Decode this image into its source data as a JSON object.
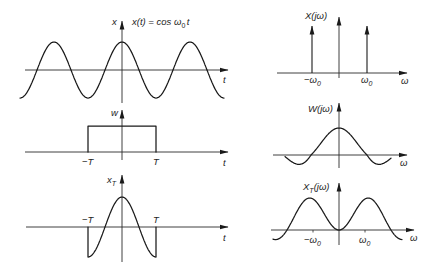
{
  "diagram_data": {
    "type": "signal-and-spectrum-panels",
    "description": "Windowing of a cosine: time-domain signals (left) and their Fourier transforms (right)",
    "left_panels": [
      {
        "id": "x",
        "signal": "x(t) = cos ω0 t",
        "shape": "cosine",
        "horizontal_axis": "t"
      },
      {
        "id": "w",
        "signal": "w(t)",
        "shape": "rectangular window from -T to T",
        "horizontal_axis": "t"
      },
      {
        "id": "xT",
        "signal": "x_T(t) = x(t) w(t)",
        "shape": "cosine truncated to [-T, T]",
        "horizontal_axis": "t"
      }
    ],
    "right_panels": [
      {
        "id": "X",
        "signal": "X(jω)",
        "shape": "impulses at -ω0 and ω0",
        "horizontal_axis": "ω"
      },
      {
        "id": "W",
        "signal": "W(jω)",
        "shape": "sinc centered at 0",
        "horizontal_axis": "ω"
      },
      {
        "id": "XT",
        "signal": "X_T(jω)",
        "shape": "sum of sincs centered at -ω0 and ω0",
        "horizontal_axis": "ω"
      }
    ]
  },
  "left": {
    "x": {
      "axis_label": "x",
      "formula_main": "x(t) = cos ω",
      "formula_sub": "0",
      "formula_tail": "t",
      "horizontal_label": "t"
    },
    "w": {
      "axis_label": "w",
      "neg_tick": "−T",
      "pos_tick": "T",
      "horizontal_label": "t"
    },
    "xT": {
      "axis_label_main": "x",
      "axis_label_sub": "T",
      "neg_tick": "−T",
      "pos_tick": "T",
      "horizontal_label": "t"
    }
  },
  "right": {
    "X": {
      "label": "X(jω)",
      "neg_tick_main": "−ω",
      "neg_tick_sub": "0",
      "pos_tick_main": "ω",
      "pos_tick_sub": "0",
      "horizontal_label": "ω"
    },
    "W": {
      "label": "W(jω)",
      "horizontal_label": "ω"
    },
    "XT": {
      "label_main": "X",
      "label_sub": "T",
      "label_tail": "(jω)",
      "neg_tick_main": "−ω",
      "neg_tick_sub": "0",
      "pos_tick_main": "ω",
      "pos_tick_sub": "0",
      "horizontal_label": "ω"
    }
  }
}
